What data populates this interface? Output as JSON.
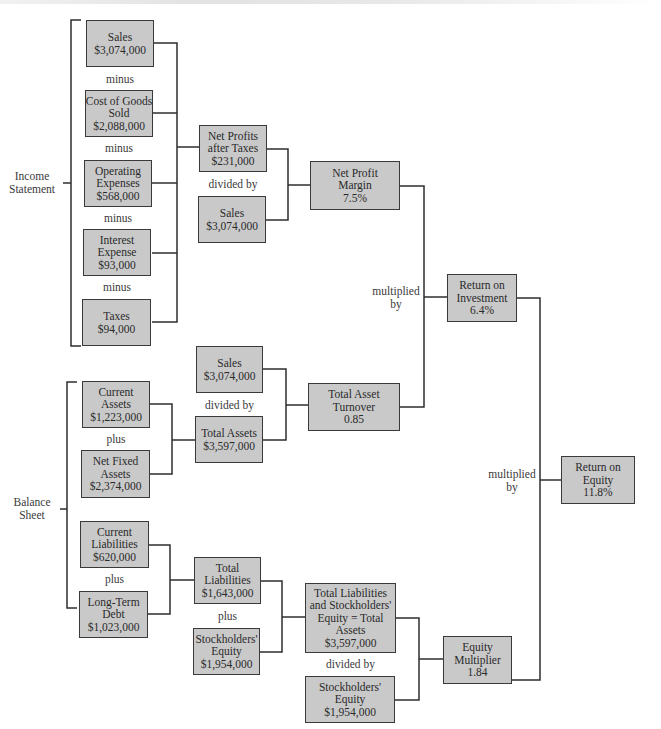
{
  "diagram": {
    "type": "du-pont-system-of-analysis",
    "groups": {
      "income_statement": "Income Statement",
      "balance_sheet": "Balance Sheet"
    },
    "nodes": {
      "sales_1": {
        "line1": "Sales",
        "line2": "$3,074,000"
      },
      "cogs": {
        "line1": "Cost of Goods",
        "line2": "Sold",
        "line3": "$2,088,000"
      },
      "opex": {
        "line1": "Operating",
        "line2": "Expenses",
        "line3": "$568,000"
      },
      "interest": {
        "line1": "Interest",
        "line2": "Expense",
        "line3": "$93,000"
      },
      "taxes": {
        "line1": "Taxes",
        "line2": "$94,000"
      },
      "npat": {
        "line1": "Net Profits",
        "line2": "after Taxes",
        "line3": "$231,000"
      },
      "sales_2": {
        "line1": "Sales",
        "line2": "$3,074,000"
      },
      "npm": {
        "line1": "Net Profit",
        "line2": "Margin",
        "line3": "7.5%"
      },
      "roi": {
        "line1": "Return on",
        "line2": "Investment",
        "line3": "6.4%"
      },
      "sales_3": {
        "line1": "Sales",
        "line2": "$3,074,000"
      },
      "current_assets": {
        "line1": "Current",
        "line2": "Assets",
        "line3": "$1,223,000"
      },
      "net_fixed_assets": {
        "line1": "Net Fixed",
        "line2": "Assets",
        "line3": "$2,374,000"
      },
      "total_assets": {
        "line1": "Total Assets",
        "line2": "$3,597,000"
      },
      "tat": {
        "line1": "Total Asset",
        "line2": "Turnover",
        "line3": "0.85"
      },
      "roe": {
        "line1": "Return on",
        "line2": "Equity",
        "line3": "11.8%"
      },
      "current_liabilities": {
        "line1": "Current",
        "line2": "Liabilities",
        "line3": "$620,000"
      },
      "long_term_debt": {
        "line1": "Long-Term",
        "line2": "Debt",
        "line3": "$1,023,000"
      },
      "total_liabilities": {
        "line1": "Total",
        "line2": "Liabilities",
        "line3": "$1,643,000"
      },
      "se_1": {
        "line1": "Stockholders'",
        "line2": "Equity",
        "line3": "$1,954,000"
      },
      "tlse": {
        "line1": "Total Liabilities",
        "line2": "and Stockholders'",
        "line3": "Equity = Total",
        "line4": "Assets",
        "line5": "$3,597,000"
      },
      "se_2": {
        "line1": "Stockholders'",
        "line2": "Equity",
        "line3": "$1,954,000"
      },
      "em": {
        "line1": "Equity",
        "line2": "Multiplier",
        "line3": "1.84"
      }
    },
    "operators": {
      "minus": "minus",
      "divided_by": "divided by",
      "plus": "plus",
      "multiplied_line1": "multiplied",
      "multiplied_line2": "by"
    },
    "colors": {
      "box_fill": "#c9c9c9",
      "box_border": "#3a3a3a",
      "line": "#2e2e2e",
      "background": "#ffffff"
    }
  }
}
